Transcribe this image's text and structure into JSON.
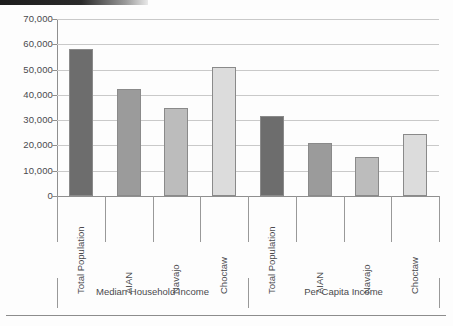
{
  "chart_data": {
    "type": "bar",
    "title": "",
    "subtitle": "",
    "xlabel": "",
    "ylabel": "",
    "ylim": [
      0,
      70000
    ],
    "grid": true,
    "legend_position": "none",
    "categories": [
      "Total Population",
      "AIAN",
      "Navajo",
      "Choctaw"
    ],
    "groups": [
      {
        "label": "Median Household Income",
        "values": [
          58000,
          42500,
          35000,
          51000
        ]
      },
      {
        "label": "Per Capita Income",
        "values": [
          31500,
          21000,
          15500,
          24500
        ]
      }
    ],
    "y_ticks": [
      0,
      10000,
      20000,
      30000,
      40000,
      50000,
      60000,
      70000
    ],
    "y_tick_labels": [
      "0",
      "10,000",
      "20,000",
      "30,000",
      "40,000",
      "50,000",
      "60,000",
      "70,000"
    ],
    "bar_colors": [
      "#6d6d6d",
      "#9b9b9b",
      "#bcbcbc",
      "#dcdcdc"
    ],
    "bar_border_color": "#8a8a8a",
    "grid_color": "#c9c9c9",
    "axis_color": "#8f8f8f",
    "text_color": "#4a4a4e",
    "background_color": "#fdfdfd"
  }
}
